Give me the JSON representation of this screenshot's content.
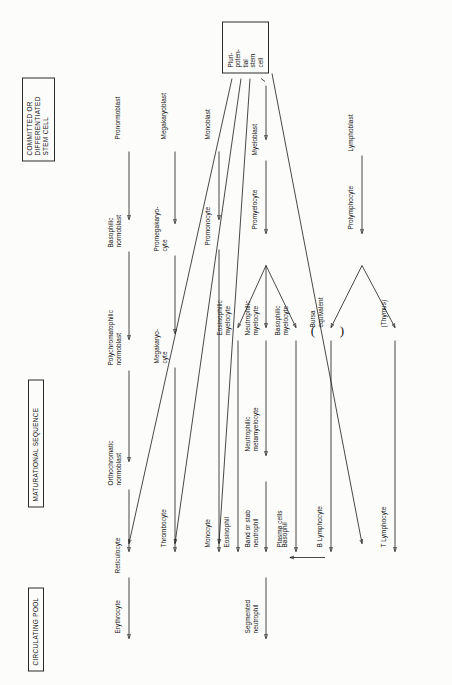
{
  "diagram": {
    "orientation": "rotated-90-ccw",
    "headers": [
      {
        "id": "committed",
        "label": "COMMITTED OR\nDIFFERENTIATED\nSTEM CELL"
      },
      {
        "id": "maturational",
        "label": "MATURATIONAL SEQUENCE"
      },
      {
        "id": "circulating",
        "label": "CIRCULATING POOL"
      }
    ],
    "stem_cell": {
      "label": "Pluri-\npoten-\ntial\nstem\ncell"
    },
    "nodes": [
      {
        "id": "pronormoblast",
        "label": "Pronormoblast"
      },
      {
        "id": "basophilic-normoblast",
        "label": "Basophilic\nnormoblast"
      },
      {
        "id": "polychromatophilic-normoblast",
        "label": "Polychromatophilic\nnormoblast"
      },
      {
        "id": "orthochromatic-normoblast",
        "label": "Orthochromatic\nnormoblast"
      },
      {
        "id": "reticulocyte",
        "label": "Reticulocyte"
      },
      {
        "id": "erythrocyte",
        "label": "Erythrocyte"
      },
      {
        "id": "megakaryoblast",
        "label": "Megakaryoblast"
      },
      {
        "id": "promegakaryocyte",
        "label": "Promegakaryo-\ncyte"
      },
      {
        "id": "megakaryocyte",
        "label": "Megakaryo-\ncyte"
      },
      {
        "id": "thrombocyte",
        "label": "Thrombocyte"
      },
      {
        "id": "monoblast",
        "label": "Monoblast"
      },
      {
        "id": "promonocyte",
        "label": "Promonocyte"
      },
      {
        "id": "monocyte",
        "label": "Monocyte"
      },
      {
        "id": "myeloblast",
        "label": "Myeloblast"
      },
      {
        "id": "promyelocyte",
        "label": "Promyelocyte"
      },
      {
        "id": "eosinophilic-myelocyte",
        "label": "Eosinophilic\nmyelocyte"
      },
      {
        "id": "eosinophil",
        "label": "Eosinophil"
      },
      {
        "id": "neutrophilic-myelocyte",
        "label": "Neutrophilic\nmyelocyte"
      },
      {
        "id": "neutrophilic-metamyelocyte",
        "label": "Neutrophilic\nmetamyelocyte"
      },
      {
        "id": "band-or-stab-neutrophil",
        "label": "Band or stab\nneutrophil"
      },
      {
        "id": "segmented-neutrophil",
        "label": "Segmented\nneutrophil"
      },
      {
        "id": "basophilic-myelocyte",
        "label": "Basophilic\nmyelocyte"
      },
      {
        "id": "basophil",
        "label": "Basophil"
      },
      {
        "id": "lymphoblast",
        "label": "Lymphoblast"
      },
      {
        "id": "prolymphocyte",
        "label": "Prolymphocyte"
      },
      {
        "id": "bursa-equivalent",
        "label": "Bursa\nequivalent"
      },
      {
        "id": "b-lymphocyte",
        "label": "B Lymphocyte"
      },
      {
        "id": "plasma-cells",
        "label": "Plasma cells"
      },
      {
        "id": "thymus",
        "label": "(Thymus)"
      },
      {
        "id": "t-lymphocyte",
        "label": "T Lymphocyte"
      }
    ],
    "colors": {
      "ink": "#1a1a1a",
      "paper": "#fcfcfb"
    }
  }
}
